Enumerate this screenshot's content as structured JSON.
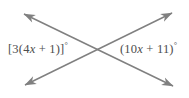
{
  "figure": {
    "type": "intersecting-lines-angle-diagram",
    "background_color": "#ffffff",
    "line_color": "#808080",
    "text_color": "#4d4d4d",
    "intersection_point": {
      "x": 99,
      "y": 50
    },
    "labels": {
      "left": {
        "full_text": "[3(4x + 1)]°",
        "prefix": "[3(4",
        "variable": "x",
        "suffix": " + 1)]",
        "degree": "°"
      },
      "right": {
        "full_text": "(10x + 11)°",
        "prefix": "(10",
        "variable": "x",
        "suffix": " + 11)",
        "degree": "°"
      }
    },
    "lines": [
      {
        "name": "line-nw-se",
        "from": {
          "x": 20,
          "y": 12
        },
        "to": {
          "x": 177,
          "y": 88
        },
        "arrowheads": "both"
      },
      {
        "name": "line-sw-ne",
        "from": {
          "x": 21,
          "y": 87
        },
        "to": {
          "x": 176,
          "y": 11
        },
        "arrowheads": "both"
      }
    ]
  }
}
